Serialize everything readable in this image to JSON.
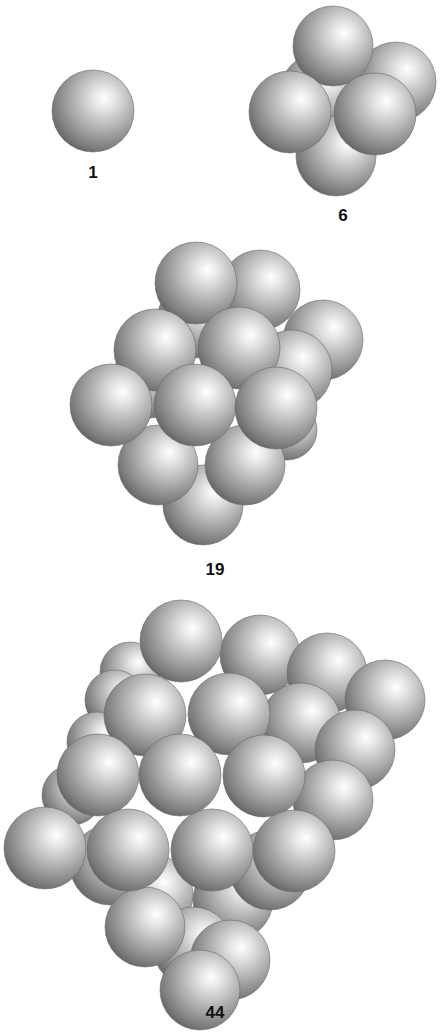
{
  "figure": {
    "background": "#ffffff",
    "sphere_colors": {
      "highlight": "#ffffff",
      "mid": "#b4b4b4",
      "shadow": "#5e5e5e"
    }
  },
  "clusters": [
    {
      "label": "1",
      "label_pos": [
        93,
        182
      ],
      "spheres": [
        [
          93,
          111,
          41
        ]
      ]
    },
    {
      "label": "6",
      "label_pos": [
        343,
        224
      ],
      "spheres": [
        [
          318,
          92,
          38
        ],
        [
          396,
          82,
          40
        ],
        [
          333,
          46,
          40
        ],
        [
          336,
          156,
          40
        ],
        [
          290,
          112,
          41
        ],
        [
          375,
          114,
          41
        ]
      ]
    },
    {
      "label": "19",
      "label_pos": [
        215,
        578
      ],
      "spheres": [
        [
          150,
          380,
          38
        ],
        [
          195,
          320,
          38
        ],
        [
          260,
          290,
          40
        ],
        [
          323,
          340,
          40
        ],
        [
          292,
          370,
          40
        ],
        [
          287,
          430,
          30
        ],
        [
          203,
          505,
          40
        ],
        [
          158,
          465,
          40
        ],
        [
          245,
          465,
          40
        ],
        [
          196,
          283,
          41
        ],
        [
          155,
          350,
          41
        ],
        [
          239,
          348,
          41
        ],
        [
          111,
          405,
          41
        ],
        [
          195,
          405,
          41
        ],
        [
          276,
          408,
          41
        ]
      ]
    },
    {
      "label": "44",
      "label_pos": [
        215,
        1020
      ],
      "spheres": [
        [
          130,
          672,
          30
        ],
        [
          115,
          700,
          30
        ],
        [
          97,
          742,
          30
        ],
        [
          72,
          795,
          30
        ],
        [
          260,
          655,
          40
        ],
        [
          327,
          673,
          40
        ],
        [
          385,
          700,
          40
        ],
        [
          301,
          723,
          40
        ],
        [
          355,
          750,
          40
        ],
        [
          333,
          800,
          40
        ],
        [
          153,
          895,
          40
        ],
        [
          110,
          865,
          40
        ],
        [
          233,
          900,
          40
        ],
        [
          193,
          947,
          40
        ],
        [
          145,
          927,
          40
        ],
        [
          230,
          960,
          40
        ],
        [
          270,
          870,
          40
        ],
        [
          200,
          990,
          40
        ],
        [
          181,
          641,
          41
        ],
        [
          145,
          715,
          41
        ],
        [
          229,
          714,
          41
        ],
        [
          98,
          775,
          41
        ],
        [
          180,
          775,
          41
        ],
        [
          264,
          776,
          41
        ],
        [
          45,
          848,
          41
        ],
        [
          128,
          850,
          41
        ],
        [
          212,
          850,
          41
        ],
        [
          294,
          851,
          41
        ]
      ]
    }
  ]
}
